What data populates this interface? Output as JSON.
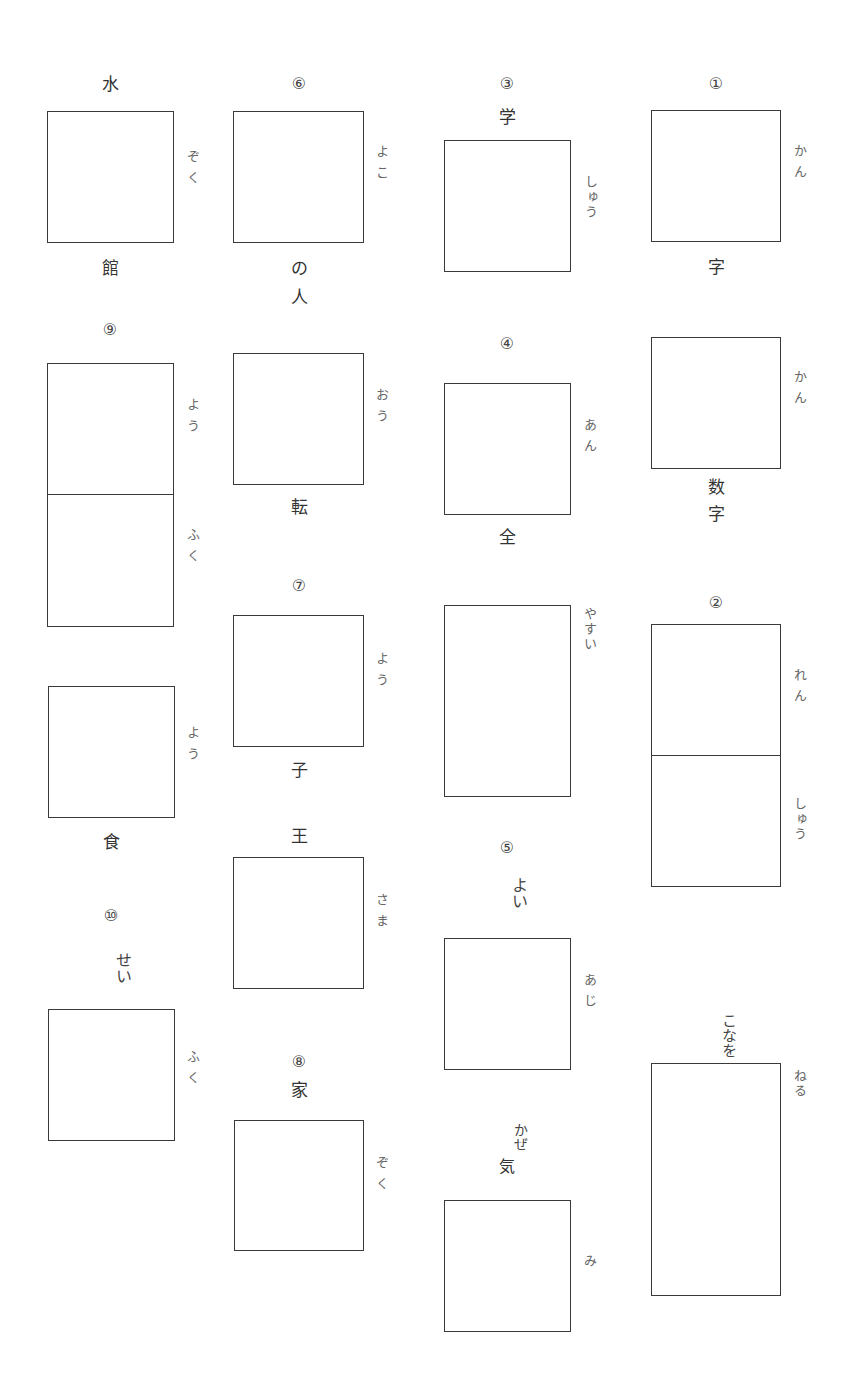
{
  "worksheet": {
    "col1": {
      "q_water": {
        "above": "水",
        "below": "館",
        "reading": "ぞく"
      },
      "q9": {
        "number": "⑨",
        "reading_top": "よう",
        "reading_bottom": "ふく"
      },
      "q_food": {
        "below": "食",
        "reading": "よう"
      },
      "q10": {
        "number": "⑩",
        "above": "せい",
        "reading": "ふく"
      }
    },
    "col2": {
      "q6": {
        "number": "⑥",
        "below_1": "の",
        "below_2": "人",
        "reading": "よこ"
      },
      "q_roll": {
        "below": "転",
        "reading": "おう"
      },
      "q7": {
        "number": "⑦",
        "below": "子",
        "reading": "よう"
      },
      "q_king": {
        "above": "王",
        "reading": "さま"
      },
      "q8": {
        "number": "⑧",
        "above": "家",
        "reading": "ぞく"
      }
    },
    "col3": {
      "q3": {
        "number": "③",
        "above": "学",
        "reading": "しゅう"
      },
      "q4": {
        "number": "④",
        "below": "全",
        "reading": "あん"
      },
      "q_cheap": {
        "reading": "やすい"
      },
      "q5": {
        "number": "⑤",
        "above": "よい",
        "reading": "あじ"
      },
      "q_cold": {
        "above_1": "かぜ",
        "above_2": "気",
        "reading": "み"
      }
    },
    "col4": {
      "q1": {
        "number": "①",
        "below": "字",
        "reading": "かん"
      },
      "q_num": {
        "below_1": "数",
        "below_2": "字",
        "reading": "かん"
      },
      "q2": {
        "number": "②",
        "reading_top": "れん",
        "reading_bottom": "しゅう"
      },
      "q_knead": {
        "above": "こなを",
        "reading": "ねる"
      }
    }
  }
}
